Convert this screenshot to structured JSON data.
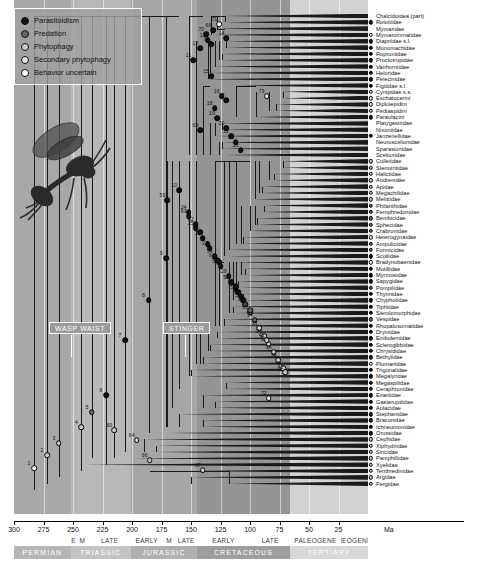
{
  "figure": {
    "type": "phylogenetic-time-tree",
    "axis_unit": "Ma"
  },
  "legend": {
    "items": [
      {
        "label": "Parasitoidism",
        "color": "#111111",
        "key": "parasitoidism"
      },
      {
        "label": "Predation",
        "color": "#666666",
        "key": "predation"
      },
      {
        "label": "Phytophagy",
        "color": "#c9c9c9",
        "key": "phytophagy"
      },
      {
        "label": "Secondary phytophagy",
        "color": "#e2e2e2",
        "key": "secondary-phytophagy"
      },
      {
        "label": "Behavior uncertain",
        "color": "#ffffff",
        "key": "behavior-uncertain"
      }
    ]
  },
  "annotations": [
    {
      "label": "WASP WAIST",
      "x": 49,
      "y": 322
    },
    {
      "label": "STINGER",
      "x": 163,
      "y": 322
    }
  ],
  "timescale": {
    "unit_label": "Ma",
    "range_start": 300,
    "range_end": 0,
    "ticks": [
      300,
      275,
      250,
      225,
      200,
      175,
      150,
      125,
      100,
      75,
      50,
      25
    ],
    "epochs": [
      {
        "label": "E",
        "from": 252,
        "to": 247
      },
      {
        "label": "M",
        "from": 247,
        "to": 237
      },
      {
        "label": "LATE",
        "from": 237,
        "to": 201
      },
      {
        "label": "EARLY",
        "from": 201,
        "to": 174
      },
      {
        "label": "M",
        "from": 174,
        "to": 163
      },
      {
        "label": "LATE",
        "from": 163,
        "to": 145
      },
      {
        "label": "EARLY",
        "from": 145,
        "to": 100
      },
      {
        "label": "LATE",
        "from": 100,
        "to": 66
      },
      {
        "label": "PALEOGENE",
        "from": 66,
        "to": 23
      },
      {
        "label": "NEOGENE",
        "from": 23,
        "to": 0
      }
    ],
    "periods": [
      {
        "label": "PERMIAN",
        "from": 300,
        "to": 252,
        "color": "#b6b6b6"
      },
      {
        "label": "TRIASSIC",
        "from": 252,
        "to": 201,
        "color": "#c4c4c4"
      },
      {
        "label": "JURASSIC",
        "from": 201,
        "to": 145,
        "color": "#b0b0b0"
      },
      {
        "label": "CRETACEOUS",
        "from": 145,
        "to": 66,
        "color": "#9e9e9e"
      },
      {
        "label": "TERTIARY",
        "from": 66,
        "to": 0,
        "color": "#d8d8d8"
      }
    ],
    "background_bands": [
      {
        "from": 300,
        "to": 252,
        "color": "#a8a8a8"
      },
      {
        "from": 252,
        "to": 201,
        "color": "#b8b8b8"
      },
      {
        "from": 201,
        "to": 145,
        "color": "#a6a6a6"
      },
      {
        "from": 145,
        "to": 66,
        "color": "#949494"
      },
      {
        "from": 66,
        "to": 0,
        "color": "#d2d2d2"
      }
    ]
  },
  "taxa": [
    {
      "name": "Chalcidoidea (part)",
      "state": "parasitoidism",
      "age": 121,
      "tip_marker": false
    },
    {
      "name": "Rotoitidae",
      "state": "parasitoidism",
      "age": 121
    },
    {
      "name": "Mymaridae",
      "state": "parasitoidism",
      "age": 128,
      "tip_marker": false
    },
    {
      "name": "Mymarommatidae",
      "state": "behavior-uncertain",
      "age": 133
    },
    {
      "name": "Diapriidae s.l.",
      "state": "parasitoidism",
      "age": 120
    },
    {
      "name": "Monomachidae",
      "state": "parasitoidism",
      "age": 120
    },
    {
      "name": "Roproniidae",
      "state": "parasitoidism",
      "age": 124
    },
    {
      "name": "Proctotrupidae",
      "state": "parasitoidism",
      "age": 124
    },
    {
      "name": "Vanhorniidae",
      "state": "parasitoidism",
      "age": 130
    },
    {
      "name": "Heloridae",
      "state": "parasitoidism",
      "age": 136
    },
    {
      "name": "Pelecinidae",
      "state": "parasitoidism",
      "age": 136
    },
    {
      "name": "Figitidae s.l.",
      "state": "parasitoidism",
      "age": 112
    },
    {
      "name": "Cynipidae s.s.",
      "state": "secondary-phytophagy",
      "age": 72
    },
    {
      "name": "Eschatocerini",
      "state": "secondary-phytophagy",
      "age": 72
    },
    {
      "name": "Diplolepidini",
      "state": "secondary-phytophagy",
      "age": 78
    },
    {
      "name": "Pediaspidini",
      "state": "secondary-phytophagy",
      "age": 78
    },
    {
      "name": "Paraulacini",
      "state": "parasitoidism",
      "age": 95
    },
    {
      "name": "Platygastridae",
      "state": "parasitoidism",
      "age": 124,
      "tip_marker": false
    },
    {
      "name": "Nixoniidae",
      "state": "parasitoidism",
      "age": 124,
      "tip_marker": false
    },
    {
      "name": "Janzenellidae",
      "state": "parasitoidism",
      "age": 130
    },
    {
      "name": "Neuroscelionidae",
      "state": "parasitoidism",
      "age": 124,
      "tip_marker": false
    },
    {
      "name": "Sparasionidae",
      "state": "parasitoidism",
      "age": 124,
      "tip_marker": false
    },
    {
      "name": "Scelionidae",
      "state": "parasitoidism",
      "age": 120,
      "tip_marker": false
    },
    {
      "name": "Colletidae",
      "state": "phytophagy",
      "age": 72
    },
    {
      "name": "Stenotritidae",
      "state": "phytophagy",
      "age": 72
    },
    {
      "name": "Halictidae",
      "state": "phytophagy",
      "age": 80
    },
    {
      "name": "Andrenidae",
      "state": "phytophagy",
      "age": 80
    },
    {
      "name": "Apidae",
      "state": "phytophagy",
      "age": 90
    },
    {
      "name": "Megachilidae",
      "state": "phytophagy",
      "age": 90
    },
    {
      "name": "Melittidae",
      "state": "phytophagy",
      "age": 96
    },
    {
      "name": "Philanthidae",
      "state": "predation",
      "age": 88
    },
    {
      "name": "Pemphredonidae",
      "state": "predation",
      "age": 88
    },
    {
      "name": "Bembicidae",
      "state": "predation",
      "age": 94
    },
    {
      "name": "Sphecidae",
      "state": "predation",
      "age": 94
    },
    {
      "name": "Crabronidae",
      "state": "predation",
      "age": 100
    },
    {
      "name": "Heterogynaidae",
      "state": "behavior-uncertain",
      "age": 106
    },
    {
      "name": "Ampulicidae",
      "state": "predation",
      "age": 106
    },
    {
      "name": "Formicidae",
      "state": "predation",
      "age": 118
    },
    {
      "name": "Scoliidae",
      "state": "parasitoidism",
      "age": 118
    },
    {
      "name": "Bradynobaenidae",
      "state": "behavior-uncertain",
      "age": 112
    },
    {
      "name": "Mutillidae",
      "state": "parasitoidism",
      "age": 104
    },
    {
      "name": "Myrmosidae",
      "state": "parasitoidism",
      "age": 104
    },
    {
      "name": "Sapygidae",
      "state": "parasitoidism",
      "age": 110
    },
    {
      "name": "Pompilidae",
      "state": "predation",
      "age": 110
    },
    {
      "name": "Thynnidae",
      "state": "parasitoidism",
      "age": 106
    },
    {
      "name": "Chyphotidae",
      "state": "parasitoidism",
      "age": 106
    },
    {
      "name": "Tiphiidae",
      "state": "parasitoidism",
      "age": 114
    },
    {
      "name": "Sierolomorphidae",
      "state": "parasitoidism",
      "age": 114
    },
    {
      "name": "Vespidae",
      "state": "predation",
      "age": 122
    },
    {
      "name": "Rhopalosomatidae",
      "state": "parasitoidism",
      "age": 122
    },
    {
      "name": "Dryinidae",
      "state": "parasitoidism",
      "age": 128
    },
    {
      "name": "Embolemidae",
      "state": "parasitoidism",
      "age": 128
    },
    {
      "name": "Sclerogibbidae",
      "state": "parasitoidism",
      "age": 134
    },
    {
      "name": "Chrysididae",
      "state": "parasitoidism",
      "age": 134
    },
    {
      "name": "Bethylidae",
      "state": "parasitoidism",
      "age": 140
    },
    {
      "name": "Plumariidae",
      "state": "behavior-uncertain",
      "age": 140
    },
    {
      "name": "Trigonalidae",
      "state": "parasitoidism",
      "age": 150
    },
    {
      "name": "Megalyridae",
      "state": "parasitoidism",
      "age": 150
    },
    {
      "name": "Megaspilidae",
      "state": "parasitoidism",
      "age": 120
    },
    {
      "name": "Ceraphronidae",
      "state": "parasitoidism",
      "age": 120
    },
    {
      "name": "Evaniidae",
      "state": "parasitoidism",
      "age": 140
    },
    {
      "name": "Gasteruptiidae",
      "state": "parasitoidism",
      "age": 130
    },
    {
      "name": "Aulacidae",
      "state": "parasitoidism",
      "age": 130
    },
    {
      "name": "Stephanidae",
      "state": "parasitoidism",
      "age": 160
    },
    {
      "name": "Braconidae",
      "state": "parasitoidism",
      "age": 140
    },
    {
      "name": "Ichneumonidae",
      "state": "parasitoidism",
      "age": 140
    },
    {
      "name": "Orussidae",
      "state": "parasitoidism",
      "age": 170
    },
    {
      "name": "Cephidae",
      "state": "phytophagy",
      "age": 190
    },
    {
      "name": "Xiphydriidae",
      "state": "phytophagy",
      "age": 180
    },
    {
      "name": "Siricidae",
      "state": "phytophagy",
      "age": 180
    },
    {
      "name": "Pamphiliidae",
      "state": "phytophagy",
      "age": 200
    },
    {
      "name": "Xyelidae",
      "state": "phytophagy",
      "age": 240
    },
    {
      "name": "Tenthredinidae",
      "state": "phytophagy",
      "age": 150
    },
    {
      "name": "Argidae",
      "state": "phytophagy",
      "age": 150
    },
    {
      "name": "Pergidae",
      "state": "phytophagy",
      "age": 118
    }
  ],
  "internal_nodes": [
    {
      "id": "1",
      "age": 283,
      "state": "behavior-uncertain"
    },
    {
      "id": "2",
      "age": 272,
      "state": "phytophagy"
    },
    {
      "id": "3",
      "age": 262,
      "state": "phytophagy"
    },
    {
      "id": "4",
      "age": 243,
      "state": "phytophagy"
    },
    {
      "id": "5",
      "age": 234,
      "state": "predation"
    },
    {
      "id": "6",
      "age": 222,
      "state": "parasitoidism"
    },
    {
      "id": "7",
      "age": 206,
      "state": "parasitoidism"
    },
    {
      "id": "8",
      "age": 186,
      "state": "parasitoidism"
    },
    {
      "id": "9",
      "age": 171,
      "state": "parasitoidism"
    },
    {
      "id": "10",
      "age": 160,
      "state": "parasitoidism"
    },
    {
      "id": "11",
      "age": 148,
      "state": "parasitoidism"
    },
    {
      "id": "12",
      "age": 142,
      "state": "parasitoidism"
    },
    {
      "id": "13",
      "age": 136,
      "state": "parasitoidism"
    },
    {
      "id": "14",
      "age": 120,
      "state": "parasitoidism"
    },
    {
      "id": "15",
      "age": 133,
      "state": "parasitoidism"
    },
    {
      "id": "16",
      "age": 124,
      "state": "parasitoidism"
    },
    {
      "id": "17",
      "age": 120,
      "state": "parasitoidism"
    },
    {
      "id": "18",
      "age": 130,
      "state": "parasitoidism"
    },
    {
      "id": "19",
      "age": 128,
      "state": "parasitoidism"
    },
    {
      "id": "20",
      "age": 120,
      "state": "parasitoidism"
    },
    {
      "id": "21",
      "age": 116,
      "state": "parasitoidism"
    },
    {
      "id": "22",
      "age": 112,
      "state": "parasitoidism"
    },
    {
      "id": "23",
      "age": 108,
      "state": "parasitoidism"
    },
    {
      "id": "24",
      "age": 152,
      "state": "parasitoidism"
    },
    {
      "id": "25",
      "age": 146,
      "state": "parasitoidism"
    },
    {
      "id": "26",
      "age": 140,
      "state": "parasitoidism"
    },
    {
      "id": "27",
      "age": 134,
      "state": "parasitoidism"
    },
    {
      "id": "28",
      "age": 126,
      "state": "parasitoidism"
    },
    {
      "id": "29",
      "age": 118,
      "state": "parasitoidism"
    },
    {
      "id": "30",
      "age": 112,
      "state": "parasitoidism"
    },
    {
      "id": "31",
      "age": 108,
      "state": "parasitoidism"
    },
    {
      "id": "32",
      "age": 104,
      "state": "predation"
    },
    {
      "id": "33",
      "age": 100,
      "state": "predation"
    },
    {
      "id": "34",
      "age": 96,
      "state": "predation"
    },
    {
      "id": "35",
      "age": 92,
      "state": "phytophagy"
    },
    {
      "id": "36",
      "age": 88,
      "state": "phytophagy"
    },
    {
      "id": "37",
      "age": 84,
      "state": "phytophagy"
    },
    {
      "id": "38",
      "age": 80,
      "state": "phytophagy"
    },
    {
      "id": "39",
      "age": 76,
      "state": "phytophagy"
    },
    {
      "id": "40",
      "age": 72,
      "state": "phytophagy"
    },
    {
      "id": "41",
      "age": 86,
      "state": "phytophagy"
    },
    {
      "id": "42",
      "age": 70,
      "state": "phytophagy"
    },
    {
      "id": "51",
      "age": 116,
      "state": "parasitoidism"
    },
    {
      "id": "52",
      "age": 110,
      "state": "parasitoidism"
    },
    {
      "id": "53",
      "age": 106,
      "state": "parasitoidism"
    },
    {
      "id": "54",
      "age": 130,
      "state": "parasitoidism"
    },
    {
      "id": "55",
      "age": 100,
      "state": "predation"
    },
    {
      "id": "56",
      "age": 125,
      "state": "parasitoidism"
    },
    {
      "id": "57",
      "age": 136,
      "state": "parasitoidism"
    },
    {
      "id": "58",
      "age": 142,
      "state": "parasitoidism"
    },
    {
      "id": "59",
      "age": 170,
      "state": "parasitoidism"
    },
    {
      "id": "60",
      "age": 215,
      "state": "phytophagy"
    },
    {
      "id": "61",
      "age": 128,
      "state": "parasitoidism"
    },
    {
      "id": "62",
      "age": 146,
      "state": "parasitoidism"
    },
    {
      "id": "63",
      "age": 152,
      "state": "parasitoidism"
    },
    {
      "id": "64",
      "age": 196,
      "state": "phytophagy"
    },
    {
      "id": "65",
      "age": 112,
      "state": "parasitoidism"
    },
    {
      "id": "66",
      "age": 185,
      "state": "phytophagy"
    },
    {
      "id": "67",
      "age": 140,
      "state": "phytophagy"
    },
    {
      "id": "68",
      "age": 131,
      "state": "parasitoidism"
    },
    {
      "id": "69",
      "age": 142,
      "state": "parasitoidism"
    },
    {
      "id": "70",
      "age": 137,
      "state": "parasitoidism"
    },
    {
      "id": "71",
      "age": 126,
      "state": "behavior-uncertain"
    },
    {
      "id": "72",
      "age": 84,
      "state": "secondary-phytophagy"
    },
    {
      "id": "73",
      "age": 86,
      "state": "secondary-phytophagy"
    },
    {
      "id": "74",
      "age": 133,
      "state": "parasitoidism"
    }
  ]
}
